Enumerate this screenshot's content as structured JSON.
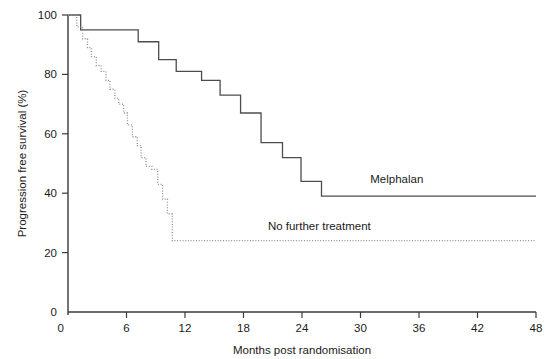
{
  "chart_data": {
    "type": "line",
    "title": "",
    "subtitle": "",
    "xlabel": "Months post randomisation",
    "ylabel": "Progression free survival (%)",
    "xlim": [
      0,
      48
    ],
    "ylim": [
      0,
      100
    ],
    "xticks": [
      0,
      6,
      12,
      18,
      24,
      30,
      36,
      42,
      48
    ],
    "xtick_labels": [
      "0",
      "6",
      "12",
      "18",
      "24",
      "30",
      "36",
      "42",
      "48"
    ],
    "yticks": [
      0,
      20,
      40,
      60,
      80,
      100
    ],
    "ytick_labels": [
      "0",
      "20",
      "40",
      "60",
      "80",
      "100"
    ],
    "grid": false,
    "legend_position": "inline-right-of-curve",
    "step_shape": "post",
    "series": [
      {
        "name": "Melphalan",
        "style": "solid",
        "color": "#4d4d4d",
        "label_text": "Melphalan",
        "label_x": 31.0,
        "label_y": 43.5,
        "x": [
          0.0,
          1.3,
          1.3,
          7.2,
          7.2,
          9.3,
          9.3,
          11.1,
          11.1,
          13.7,
          13.7,
          15.6,
          15.6,
          17.7,
          17.7,
          19.8,
          19.8,
          22.0,
          22.0,
          23.9,
          23.9,
          26.0,
          26.0,
          48.0
        ],
        "y": [
          100,
          100,
          95,
          95,
          91,
          91,
          85,
          85,
          81,
          81,
          78,
          78,
          73,
          73,
          67,
          67,
          57,
          57,
          52,
          52,
          44,
          44,
          39,
          39
        ],
        "points": [
          {
            "months": 0.0,
            "survival": 100
          },
          {
            "months": 1.3,
            "survival": 95
          },
          {
            "months": 7.2,
            "survival": 91
          },
          {
            "months": 9.3,
            "survival": 85
          },
          {
            "months": 11.1,
            "survival": 81
          },
          {
            "months": 13.7,
            "survival": 78
          },
          {
            "months": 15.6,
            "survival": 73
          },
          {
            "months": 17.7,
            "survival": 67
          },
          {
            "months": 19.8,
            "survival": 57
          },
          {
            "months": 22.0,
            "survival": 52
          },
          {
            "months": 23.9,
            "survival": 44
          },
          {
            "months": 26.0,
            "survival": 39
          },
          {
            "months": 48.0,
            "survival": 39
          }
        ]
      },
      {
        "name": "No further treatment",
        "style": "dotted",
        "color": "#8f8f8f",
        "label_text": "No further treatment",
        "label_x": 20.5,
        "label_y": 27.5,
        "x": [
          0.0,
          0.9,
          0.9,
          1.5,
          1.5,
          2.0,
          2.0,
          2.4,
          2.4,
          2.9,
          2.9,
          3.4,
          3.4,
          3.9,
          3.9,
          4.3,
          4.3,
          4.8,
          4.8,
          5.2,
          5.2,
          5.7,
          5.7,
          6.1,
          6.1,
          6.6,
          6.6,
          7.1,
          7.1,
          7.5,
          7.5,
          8.0,
          8.0,
          8.6,
          8.6,
          9.2,
          9.2,
          9.7,
          9.7,
          10.2,
          10.2,
          10.7,
          10.7,
          48.0
        ],
        "y": [
          100,
          100,
          96,
          96,
          92,
          92,
          89,
          89,
          86,
          86,
          83,
          83,
          81,
          81,
          78,
          78,
          75,
          75,
          72,
          72,
          70,
          70,
          67,
          67,
          63,
          63,
          59,
          59,
          56,
          56,
          52,
          52,
          49,
          49,
          48,
          48,
          43,
          43,
          38,
          38,
          33,
          33,
          24,
          24
        ],
        "points": [
          {
            "months": 0.0,
            "survival": 100
          },
          {
            "months": 0.9,
            "survival": 96
          },
          {
            "months": 1.5,
            "survival": 92
          },
          {
            "months": 2.0,
            "survival": 89
          },
          {
            "months": 2.4,
            "survival": 86
          },
          {
            "months": 2.9,
            "survival": 83
          },
          {
            "months": 3.4,
            "survival": 81
          },
          {
            "months": 3.9,
            "survival": 78
          },
          {
            "months": 4.3,
            "survival": 75
          },
          {
            "months": 4.8,
            "survival": 72
          },
          {
            "months": 5.2,
            "survival": 70
          },
          {
            "months": 5.7,
            "survival": 67
          },
          {
            "months": 6.1,
            "survival": 63
          },
          {
            "months": 6.6,
            "survival": 59
          },
          {
            "months": 7.1,
            "survival": 56
          },
          {
            "months": 7.5,
            "survival": 52
          },
          {
            "months": 8.0,
            "survival": 49
          },
          {
            "months": 8.6,
            "survival": 48
          },
          {
            "months": 9.2,
            "survival": 43
          },
          {
            "months": 9.7,
            "survival": 38
          },
          {
            "months": 10.2,
            "survival": 33
          },
          {
            "months": 10.7,
            "survival": 24
          },
          {
            "months": 48.0,
            "survival": 24
          }
        ]
      }
    ]
  },
  "colors": {
    "axis": "#3a3a3a",
    "melphalan": "#4d4d4d",
    "no_further_treatment": "#8f8f8f",
    "background": "#ffffff",
    "text": "#1a1a1a"
  }
}
